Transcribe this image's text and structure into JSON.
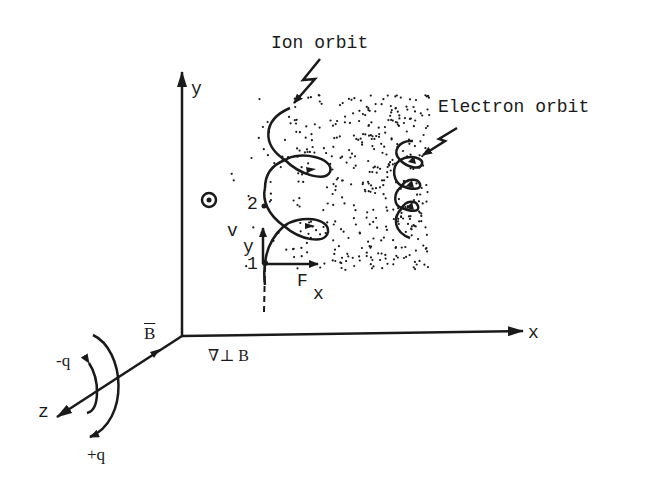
{
  "diagram": {
    "type": "gradient-B drift of ions and electrons",
    "colors": {
      "ink": "#1a1a1a",
      "background": "#ffffff"
    },
    "labels": {
      "ion_orbit": "Ion orbit",
      "electron_orbit": "Electron orbit",
      "axis_x": "x",
      "axis_y": "y",
      "axis_z": "z",
      "b_field": "B",
      "grad_b": "∇⊥ B",
      "point_1": "1",
      "point_2": "2",
      "velocity_v": "v",
      "velocity_sub": "y",
      "force_f": "F",
      "force_sub": "x",
      "minus_q": "-q",
      "plus_q": "+q"
    },
    "symbols": {
      "b_out_of_page": "dot-in-circle"
    }
  }
}
